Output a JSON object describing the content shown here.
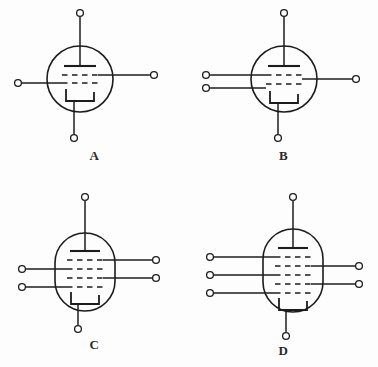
{
  "figure": {
    "background_color": "#fdfdfd",
    "line_color": "#1c1c1c",
    "symbol_count": 4
  },
  "tubes": [
    {
      "id": "A",
      "label": "A",
      "envelope_shape": "circle",
      "grid_count": 2,
      "left_terminal_count": 1,
      "right_terminal_count": 1,
      "anode_terminals": 1,
      "cathode_terminals": 1,
      "tube_type": "triode"
    },
    {
      "id": "B",
      "label": "B",
      "envelope_shape": "circle",
      "grid_count": 2,
      "left_terminal_count": 2,
      "right_terminal_count": 1,
      "anode_terminals": 1,
      "cathode_terminals": 1,
      "tube_type": "tetrode"
    },
    {
      "id": "C",
      "label": "C",
      "envelope_shape": "oval",
      "grid_count": 4,
      "left_terminal_count": 2,
      "right_terminal_count": 2,
      "anode_terminals": 1,
      "cathode_terminals": 1,
      "tube_type": "hexode"
    },
    {
      "id": "D",
      "label": "D",
      "envelope_shape": "oval",
      "grid_count": 5,
      "left_terminal_count": 3,
      "right_terminal_count": 2,
      "anode_terminals": 1,
      "cathode_terminals": 1,
      "tube_type": "heptode"
    }
  ]
}
